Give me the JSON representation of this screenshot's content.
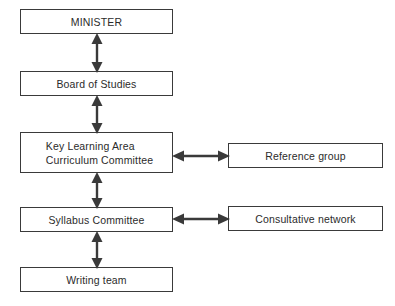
{
  "diagram": {
    "type": "organisational-flowchart",
    "background_color": "#ffffff",
    "line_color": "#3a3a3a",
    "text_color": "#2b2b2b",
    "nodes": [
      {
        "id": "minister",
        "label": "MINISTER",
        "column": "left",
        "order": 1
      },
      {
        "id": "board",
        "label": "Board of Studies",
        "column": "left",
        "order": 2
      },
      {
        "id": "kla",
        "label": "Key Learning  Area\nCurriculum Committee",
        "column": "left",
        "order": 3
      },
      {
        "id": "syllabus",
        "label": "Syllabus Committee",
        "column": "left",
        "order": 4
      },
      {
        "id": "writing",
        "label": "Writing team",
        "column": "left",
        "order": 5
      },
      {
        "id": "reference",
        "label": "Reference group",
        "column": "right",
        "order": 1
      },
      {
        "id": "consultative",
        "label": "Consultative network",
        "column": "right",
        "order": 2
      }
    ],
    "connectors": [
      {
        "id": "minister-board",
        "from": "minister",
        "to": "board",
        "orientation": "vertical",
        "arrowheads": "both"
      },
      {
        "id": "board-kla",
        "from": "board",
        "to": "kla",
        "orientation": "vertical",
        "arrowheads": "both"
      },
      {
        "id": "kla-syllabus",
        "from": "kla",
        "to": "syllabus",
        "orientation": "vertical",
        "arrowheads": "both"
      },
      {
        "id": "syllabus-writing",
        "from": "syllabus",
        "to": "writing",
        "orientation": "vertical",
        "arrowheads": "both"
      },
      {
        "id": "kla-reference",
        "from": "kla",
        "to": "reference",
        "orientation": "horizontal",
        "arrowheads": "both"
      },
      {
        "id": "syllabus-consult",
        "from": "syllabus",
        "to": "consultative",
        "orientation": "horizontal",
        "arrowheads": "both"
      }
    ]
  }
}
